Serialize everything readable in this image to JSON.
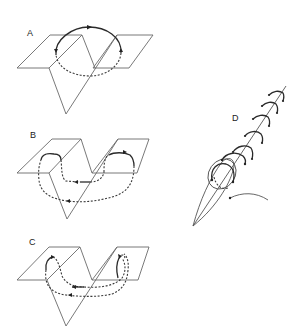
{
  "figure": {
    "panels": [
      {
        "id": "A",
        "label": "A",
        "description": "single loop encircling fold edge; solid upper arc, dashed lower arc"
      },
      {
        "id": "B",
        "label": "B",
        "description": "two loops on separate planes joined by dashed path beneath fold"
      },
      {
        "id": "C",
        "label": "C",
        "description": "two arcs on planes connected by dashed paths passing under the V"
      },
      {
        "id": "D",
        "label": "D",
        "description": "spindle-shaped body along a diagonal axis with a series of small arcs"
      }
    ],
    "colors": {
      "background": "#ffffff",
      "line": "#2a2a2a",
      "plane": "#6a6a6a"
    }
  }
}
